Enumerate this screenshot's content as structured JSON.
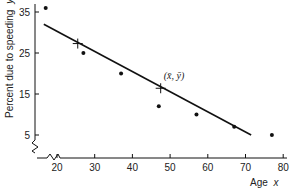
{
  "chart_data": {
    "type": "scatter",
    "title": "",
    "xlabel": "Age",
    "xlabel_var": "x",
    "ylabel": "Percent due to speeding",
    "ylabel_var": "y",
    "xlim": [
      14,
      82
    ],
    "ylim": [
      0,
      37
    ],
    "x_ticks": [
      20,
      30,
      40,
      50,
      60,
      70,
      80
    ],
    "y_ticks": [
      5,
      15,
      25,
      35
    ],
    "grid": false,
    "legend": "none",
    "axis_breaks": true,
    "series": [
      {
        "name": "observations",
        "type": "scatter",
        "points": [
          {
            "x": 17,
            "y": 36
          },
          {
            "x": 27,
            "y": 25
          },
          {
            "x": 37,
            "y": 20
          },
          {
            "x": 47,
            "y": 12
          },
          {
            "x": 57,
            "y": 10
          },
          {
            "x": 67,
            "y": 7
          },
          {
            "x": 77,
            "y": 5
          }
        ]
      },
      {
        "name": "least-squares line",
        "type": "line",
        "points": [
          {
            "x": 16.5,
            "y": 32
          },
          {
            "x": 71.5,
            "y": 5
          }
        ]
      }
    ],
    "markers": [
      {
        "x": 25.5,
        "y": 27.3,
        "shape": "cross"
      },
      {
        "x": 47.5,
        "y": 16.4,
        "shape": "cross",
        "label": "(x̄, ȳ)"
      }
    ],
    "annotations": [
      {
        "text": "(x̄, ȳ)",
        "x": 47.5,
        "y": 16.4
      }
    ]
  },
  "colors": {
    "ink": "#111111",
    "background": "#ffffff"
  }
}
